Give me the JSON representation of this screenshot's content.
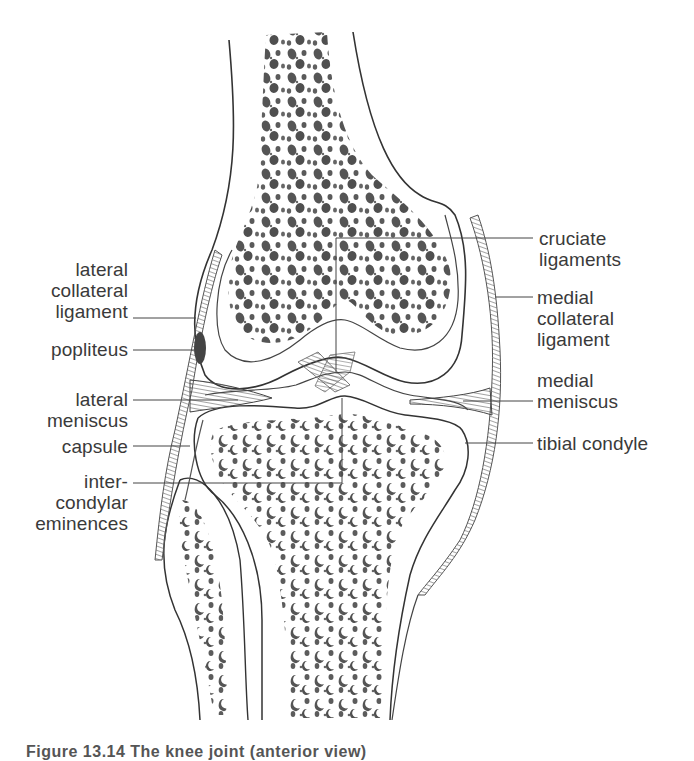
{
  "figure": {
    "caption": "Figure 13.14  The knee joint (anterior view)",
    "labels_left": {
      "lateral_collateral_ligament": "lateral\ncollateral\nligament",
      "popliteus": "popliteus",
      "lateral_meniscus": "lateral\nmeniscus",
      "capsule": "capsule",
      "intercondylar_eminences": "inter-\ncondylar\neminences"
    },
    "labels_right": {
      "cruciate_ligaments": "cruciate\nligaments",
      "medial_collateral_ligament": "medial\ncollateral\nligament",
      "medial_meniscus": "medial\nmeniscus",
      "tibial_condyle": "tibial condyle"
    },
    "colors": {
      "outline": "#333333",
      "trabecular": "#555555",
      "ligament": "#777777",
      "leader_line": "#444444"
    }
  }
}
